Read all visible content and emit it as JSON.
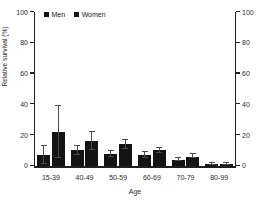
{
  "chart_data": {
    "type": "bar",
    "title": "",
    "xlabel": "Age",
    "ylabel": "Relative survival (%)",
    "ylim": [
      0,
      100
    ],
    "yticks": [
      0,
      20,
      40,
      60,
      80,
      100
    ],
    "ytick_labels": [
      "0",
      "20",
      "40",
      "60",
      "80",
      "100"
    ],
    "right_axis": {
      "ylim": [
        0,
        100
      ],
      "yticks": [
        0,
        20,
        40,
        60,
        80,
        100
      ],
      "ytick_labels": [
        "0",
        "20",
        "40",
        "60",
        "80",
        "100"
      ]
    },
    "grid": false,
    "legend_position": "top-left",
    "categories": [
      "15-39",
      "40-49",
      "50-59",
      "60-69",
      "70-79",
      "80-99"
    ],
    "series": [
      {
        "name": "Men",
        "color": "#141414",
        "values": [
          7,
          10,
          7.5,
          7,
          4,
          1
        ],
        "error_low": [
          1,
          7,
          5.5,
          5,
          3,
          0.5
        ],
        "error_high": [
          13,
          13,
          9.5,
          9,
          5,
          1.8
        ]
      },
      {
        "name": "Women",
        "color": "#141414",
        "values": [
          22,
          16,
          14,
          10,
          6,
          1.2
        ],
        "error_low": [
          5,
          10,
          11,
          8.5,
          5,
          0.7
        ],
        "error_high": [
          39,
          22,
          17,
          11.5,
          7.5,
          2
        ]
      }
    ]
  },
  "legend": {
    "items": [
      {
        "label": "Men",
        "color": "#141414"
      },
      {
        "label": "Women",
        "color": "#141414"
      }
    ]
  }
}
